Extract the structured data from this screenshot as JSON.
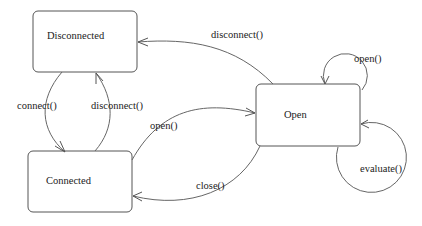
{
  "diagram": {
    "type": "state-machine",
    "states": [
      {
        "id": "disconnected",
        "label": "Disconnected"
      },
      {
        "id": "connected",
        "label": "Connected"
      },
      {
        "id": "open",
        "label": "Open"
      }
    ],
    "transitions": [
      {
        "from": "disconnected",
        "to": "connected",
        "label": "connect()"
      },
      {
        "from": "connected",
        "to": "disconnected",
        "label": "disconnect()"
      },
      {
        "from": "open",
        "to": "disconnected",
        "label": "disconnect()"
      },
      {
        "from": "connected",
        "to": "open",
        "label": "open()"
      },
      {
        "from": "open",
        "to": "connected",
        "label": "close()"
      },
      {
        "from": "open",
        "to": "open",
        "label": "open()"
      },
      {
        "from": "open",
        "to": "open",
        "label": "evaluate()"
      }
    ]
  }
}
